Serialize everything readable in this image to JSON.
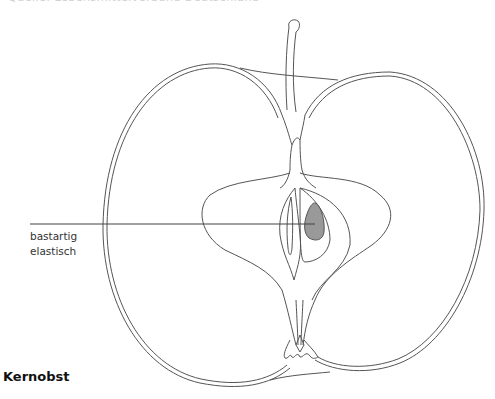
{
  "top_caption": "Quelle: Lebensmittelverband Deutschland",
  "diagram": {
    "colors": {
      "outline": "#555555",
      "seed_fill": "#999999",
      "pointer_line": "#444444",
      "background": "#ffffff"
    },
    "annotations": [
      {
        "line1": "bastartig",
        "line2": "elastisch",
        "points_to": "seed-core"
      }
    ]
  },
  "title": "Kernobst"
}
